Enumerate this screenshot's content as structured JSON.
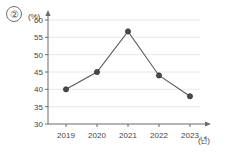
{
  "figure": {
    "item_number": "②",
    "y_unit_label": "(%)",
    "x_unit_label": "(년)"
  },
  "chart_data": {
    "type": "line",
    "title": "",
    "xlabel": "(년)",
    "ylabel": "(%)",
    "categories": [
      "2019",
      "2020",
      "2021",
      "2022",
      "2023"
    ],
    "values": [
      40,
      45,
      56.7,
      44,
      38
    ],
    "series": [
      {
        "name": "비율",
        "values": [
          40,
          45,
          56.7,
          44,
          38
        ]
      }
    ],
    "ylim": [
      30,
      60
    ],
    "ytick_labels": [
      "30",
      "35",
      "40",
      "45",
      "50",
      "55",
      "60"
    ],
    "ytick_values": [
      30,
      35,
      40,
      45,
      50,
      55,
      60
    ],
    "xtick_labels": [
      "2019",
      "2020",
      "2021",
      "2022",
      "2023"
    ],
    "grid": true,
    "grid_axis": "y",
    "legend": false,
    "legend_position": "none",
    "marker": "circle",
    "line_color": "#5a5a5a",
    "marker_color": "#4a4a4a",
    "grid_color": "#e2e2e2",
    "axis_color": "#6b6b6b",
    "background_color": "#ffffff"
  }
}
